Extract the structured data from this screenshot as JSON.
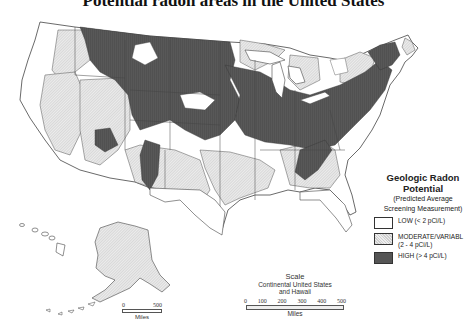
{
  "title": "Potential radon areas in the United States",
  "legend": {
    "heading_line1": "Geologic Radon",
    "heading_line2": "Potential",
    "subheading_line1": "(Predicted Average",
    "subheading_line2": "Screening Measurement)",
    "items": [
      {
        "key": "low",
        "label": "LOW  (< 2 pCi/L)",
        "color": "#ffffff"
      },
      {
        "key": "moderate",
        "label": "MODERATE/VARIABL (2 - 4 pCi/L)",
        "color": "#dcdcdc"
      },
      {
        "key": "high",
        "label": "HIGH  (> 4 pCi/L)",
        "color": "#555555"
      }
    ]
  },
  "scale": {
    "title": "Scale",
    "subtitle_line1": "Continental United States",
    "subtitle_line2": "and Hawaii",
    "ticks": [
      "0",
      "100",
      "200",
      "300",
      "400",
      "500"
    ],
    "unit": "Miles"
  },
  "alaska_scale": {
    "ticks": [
      "0",
      "500"
    ],
    "unit": "Miles"
  },
  "colors": {
    "low": "#ffffff",
    "moderate": "#dcdcdc",
    "high": "#555555",
    "border": "#444444"
  }
}
